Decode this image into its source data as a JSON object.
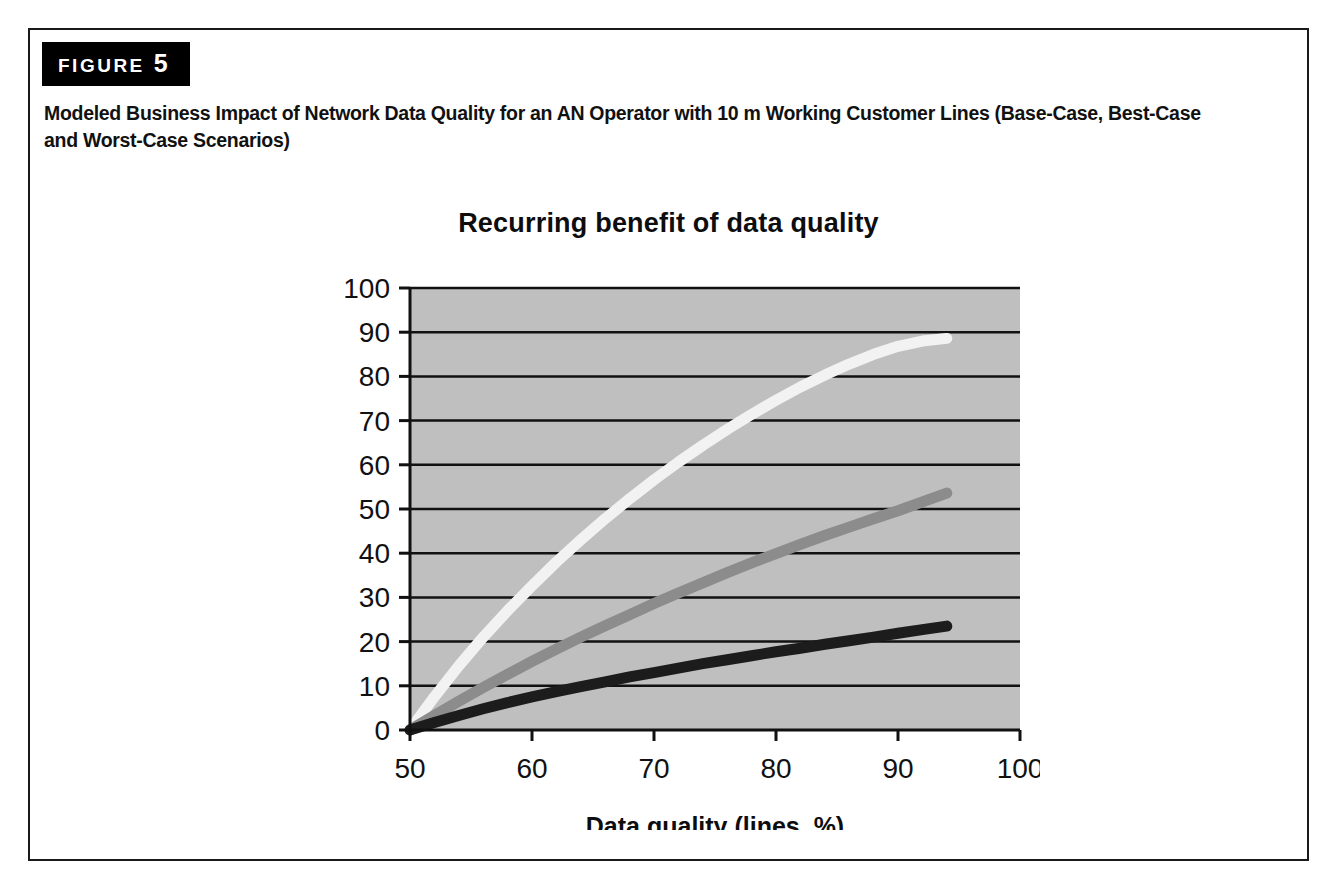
{
  "figure": {
    "badge_word": "FIGURE",
    "badge_number": "5",
    "caption": "Modeled Business Impact of Network Data Quality for an AN Operator with 10 m Working Customer Lines (Base-Case, Best-Case and Worst-Case Scenarios)"
  },
  "colors": {
    "plot_background": "#bfbfbf",
    "gridline": "#111111",
    "axis": "#111111",
    "best_case": "#f2f2f2",
    "base_case": "#8c8c8c",
    "worst_case": "#1c1c1c",
    "frame_border": "#1a1a1a",
    "badge_background": "#000000"
  },
  "chart_data": {
    "type": "line",
    "title": "Recurring benefit of data quality",
    "xlabel": "Data quality (lines, %)",
    "ylabel": "",
    "xlim": [
      50,
      100
    ],
    "ylim": [
      0,
      100
    ],
    "xticks": [
      50,
      60,
      70,
      80,
      90,
      100
    ],
    "yticks": [
      0,
      10,
      20,
      30,
      40,
      50,
      60,
      70,
      80,
      90,
      100
    ],
    "grid": true,
    "legend": "none",
    "x": [
      50,
      52,
      54,
      56,
      58,
      60,
      62,
      64,
      66,
      68,
      70,
      72,
      74,
      76,
      78,
      80,
      82,
      84,
      86,
      88,
      90,
      92,
      94
    ],
    "series": [
      {
        "name": "Best-Case",
        "color": "#f2f2f2",
        "values": [
          0,
          7.5,
          14.5,
          21.0,
          27.0,
          32.6,
          38.0,
          43.0,
          47.8,
          52.3,
          56.6,
          60.6,
          64.4,
          68.0,
          71.4,
          74.6,
          77.6,
          80.3,
          82.8,
          85.0,
          86.8,
          88.0,
          88.6
        ]
      },
      {
        "name": "Base-Case",
        "color": "#8c8c8c",
        "values": [
          0,
          3.3,
          6.5,
          9.6,
          12.6,
          15.5,
          18.3,
          21.0,
          23.6,
          26.1,
          28.6,
          31.0,
          33.3,
          35.6,
          37.8,
          39.9,
          42.0,
          44.0,
          45.9,
          47.8,
          49.6,
          51.6,
          53.6
        ]
      },
      {
        "name": "Worst-Case",
        "color": "#1c1c1c",
        "values": [
          0,
          1.7,
          3.3,
          4.8,
          6.2,
          7.5,
          8.7,
          9.8,
          10.9,
          12.0,
          13.0,
          14.0,
          15.0,
          15.9,
          16.8,
          17.7,
          18.5,
          19.4,
          20.2,
          21.0,
          21.9,
          22.7,
          23.5
        ]
      }
    ]
  }
}
